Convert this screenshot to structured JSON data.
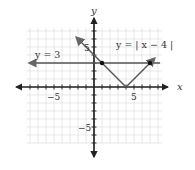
{
  "chart_data": {
    "type": "line",
    "title": "",
    "xlabel": "x",
    "ylabel": "y",
    "xlim": [
      -8,
      8
    ],
    "ylim": [
      -7,
      7
    ],
    "grid": true,
    "tick_labels": {
      "x": [
        {
          "value": -5,
          "label": "−5"
        },
        {
          "value": 5,
          "label": "5"
        }
      ],
      "y": [
        {
          "value": 5,
          "label": "5"
        },
        {
          "value": -5,
          "label": "−5"
        }
      ]
    },
    "series": [
      {
        "name": "y = 3",
        "label": "y = 3",
        "kind": "horizontal-line",
        "points": [
          [
            -8,
            3
          ],
          [
            8,
            3
          ]
        ]
      },
      {
        "name": "y = |x − 4|",
        "label": "y = | x − 4 |",
        "kind": "absolute-value",
        "points": [
          [
            -2,
            6
          ],
          [
            4,
            0
          ],
          [
            7.5,
            3.5
          ]
        ]
      }
    ],
    "intersections": [
      [
        1,
        3
      ],
      [
        7,
        3
      ]
    ],
    "vertex": [
      4,
      0
    ]
  },
  "labels": {
    "x_axis": "x",
    "y_axis": "y",
    "line1": "y = 3",
    "line2": "y = | x − 4 |",
    "x_neg5": "−5",
    "x_pos5": "5",
    "y_pos5": "5",
    "y_neg5": "−5"
  },
  "colors": {
    "grid": "#d8d8d8",
    "axis": "#222222",
    "graph": "#555555",
    "point": "#111111"
  }
}
